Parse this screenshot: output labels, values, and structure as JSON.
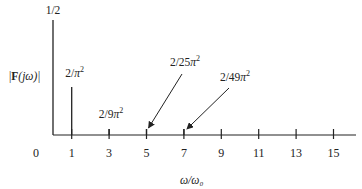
{
  "chart_data": {
    "type": "bar",
    "title": "",
    "xlabel": "ω/ω₀",
    "ylabel": "|F(jω)|",
    "ylabel_parts": {
      "prefix": "|",
      "bold": "F",
      "suffix": "(jω)|"
    },
    "xlim": [
      0,
      16
    ],
    "ylim": [
      0,
      0.5
    ],
    "grid": false,
    "x_ticks": [
      0,
      1,
      3,
      5,
      7,
      9,
      11,
      13,
      15
    ],
    "x_tick_labels": [
      "0",
      "1",
      "3",
      "5",
      "7",
      "9",
      "11",
      "13",
      "15"
    ],
    "lines": [
      {
        "x": 0,
        "value": 0.5,
        "label": "1/2"
      },
      {
        "x": 1,
        "value": 0.2026,
        "label": "2/π²"
      },
      {
        "x": 3,
        "value": 0.0225,
        "label": "2/9π²"
      },
      {
        "x": 5,
        "value": 0.0081,
        "label": "2/25π²",
        "arrow": true
      },
      {
        "x": 7,
        "value": 0.0041,
        "label": "2/49π²",
        "arrow": true
      }
    ]
  }
}
